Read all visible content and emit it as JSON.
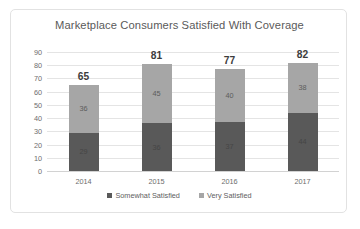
{
  "chart_data": {
    "type": "bar",
    "stacked": true,
    "title": "Marketplace Consumers Satisfied With Coverage",
    "xlabel": "",
    "ylabel": "",
    "categories": [
      "2014",
      "2015",
      "2016",
      "2017"
    ],
    "series": [
      {
        "name": "Somewhat Satisfied",
        "values": [
          29,
          36,
          37,
          44
        ],
        "color": "#595959"
      },
      {
        "name": "Very Satisfied",
        "values": [
          36,
          45,
          40,
          38
        ],
        "color": "#a6a6a6"
      }
    ],
    "totals": [
      65,
      81,
      77,
      82
    ],
    "ylim": [
      0,
      90
    ],
    "ytick_step": 10,
    "yticks": [
      "90",
      "80",
      "70",
      "60",
      "50",
      "40",
      "30",
      "20",
      "10",
      "0"
    ],
    "grid": true,
    "legend_position": "bottom"
  },
  "legend": {
    "items": [
      {
        "label": "Somewhat Satisfied",
        "color": "#595959"
      },
      {
        "label": "Very Satisfied",
        "color": "#a6a6a6"
      }
    ]
  }
}
